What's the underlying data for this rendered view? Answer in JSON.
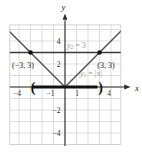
{
  "figure": {
    "axes": {
      "x_label": "x",
      "y_label": "y"
    },
    "ticks": {
      "x_labels": [
        "−4",
        "−1",
        "1",
        "4"
      ],
      "y_labels": [
        "4",
        "2",
        "−2",
        "−4"
      ]
    },
    "labels": {
      "y2": {
        "base": "y",
        "sub": "2",
        "rest": " = 3"
      },
      "y1": {
        "base": "y",
        "sub": "1",
        "rest": " = |x|"
      },
      "point_left": "(−3, 3)",
      "point_right": "(3, 3)"
    },
    "interval": {
      "open": "(",
      "close": ")"
    }
  },
  "chart_data": {
    "type": "line",
    "series": [
      {
        "name": "y1 = |x|",
        "expression": "y = |x|",
        "x": [
          -5,
          0,
          5
        ],
        "y": [
          5,
          0,
          5
        ]
      },
      {
        "name": "y2 = 3",
        "expression": "y = 3",
        "x": [
          -5,
          5
        ],
        "y": [
          3,
          3
        ]
      }
    ],
    "marked_points": [
      {
        "x": -3,
        "y": 3,
        "label": "(−3, 3)"
      },
      {
        "x": 3,
        "y": 3,
        "label": "(3, 3)"
      }
    ],
    "interval_on_x_axis": {
      "type": "open",
      "from": -3,
      "to": 3
    },
    "xlabel": "x",
    "ylabel": "y",
    "x_ticks_labeled": [
      -4,
      -1,
      1,
      4
    ],
    "y_ticks_labeled": [
      4,
      2,
      -2,
      -4
    ],
    "xlim": [
      -4.8,
      4.85
    ],
    "ylim": [
      -5,
      5.4
    ],
    "grid": true,
    "legend": "none"
  },
  "colors": {
    "background": "#ffffff",
    "grid": "#d0d0d0",
    "axis": "#2b2b2b",
    "series": [
      "#4f4f4f",
      "#3a3a3a"
    ],
    "series_width": [
      1.4,
      1.6
    ],
    "emphasis": "#111111",
    "label_gray": "#9a9a9a"
  }
}
